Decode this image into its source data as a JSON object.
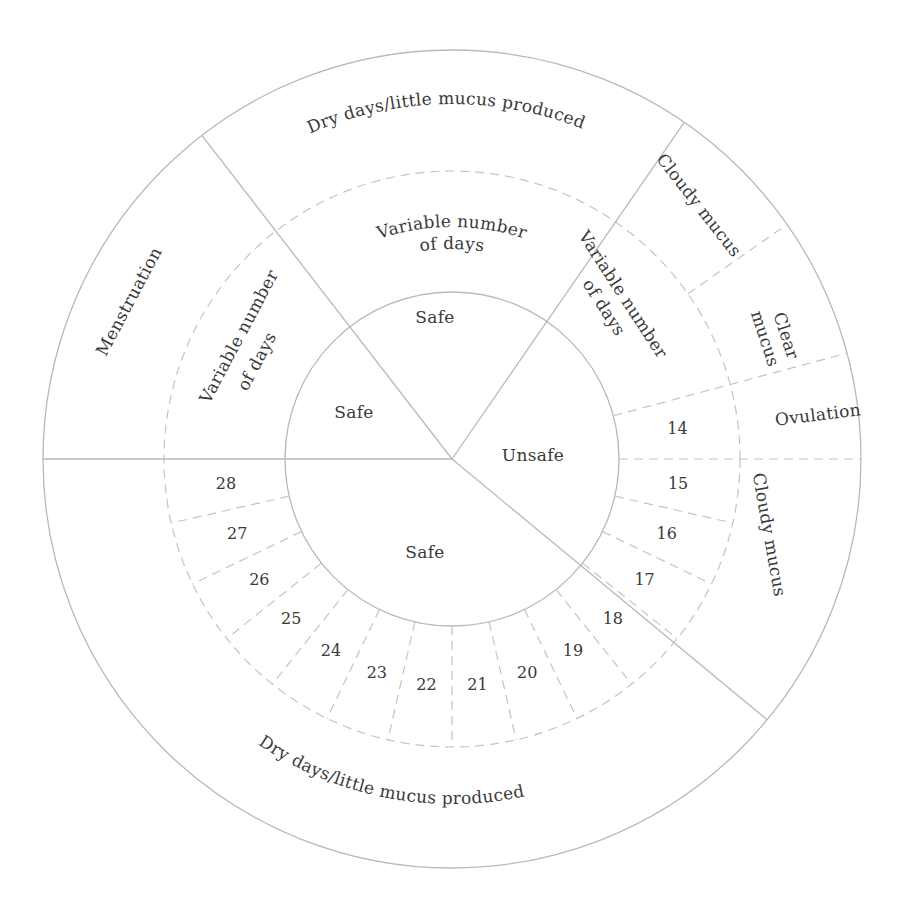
{
  "colors": {
    "line": "#b9b9b9",
    "text": "#3a3a3a",
    "background": "#ffffff"
  },
  "geometry": {
    "center": [
      452,
      459
    ],
    "r_inner": 167,
    "r_mid": 288,
    "r_outer": 409,
    "dividers_deg": {
      "menstruation_start": 180,
      "menstruation_end": 127.7,
      "unsafe_start": 55.4,
      "unsafe_end": -39.6,
      "ovulation_low": 0,
      "ovulation_high": 15,
      "clear_high": 35
    }
  },
  "inner_ring": [
    {
      "label": "Safe",
      "pos": [
        354,
        413
      ]
    },
    {
      "label": "Safe",
      "pos": [
        435,
        318
      ]
    },
    {
      "label": "Unsafe",
      "pos": [
        533,
        456
      ]
    },
    {
      "label": "Safe",
      "pos": [
        425,
        553
      ]
    }
  ],
  "middle_ring": {
    "variable_top": {
      "lines": [
        "Variable number",
        "of days"
      ]
    },
    "variable_left": {
      "lines": [
        "Variable number",
        "of days"
      ]
    },
    "variable_right": {
      "lines": [
        "Variable number",
        "of days"
      ]
    },
    "days": [
      "14",
      "15",
      "16",
      "17",
      "18",
      "19",
      "20",
      "21",
      "22",
      "23",
      "24",
      "25",
      "26",
      "27",
      "28"
    ]
  },
  "outer_ring": {
    "menstruation": "Menstruation",
    "dry_top": "Dry days/little mucus produced",
    "cloudy_top": "Cloudy mucus",
    "clear": [
      "Clear",
      "mucus"
    ],
    "ovulation": "Ovulation",
    "cloudy_bottom": "Cloudy mucus",
    "dry_bottom": "Dry days/little mucus produced"
  }
}
